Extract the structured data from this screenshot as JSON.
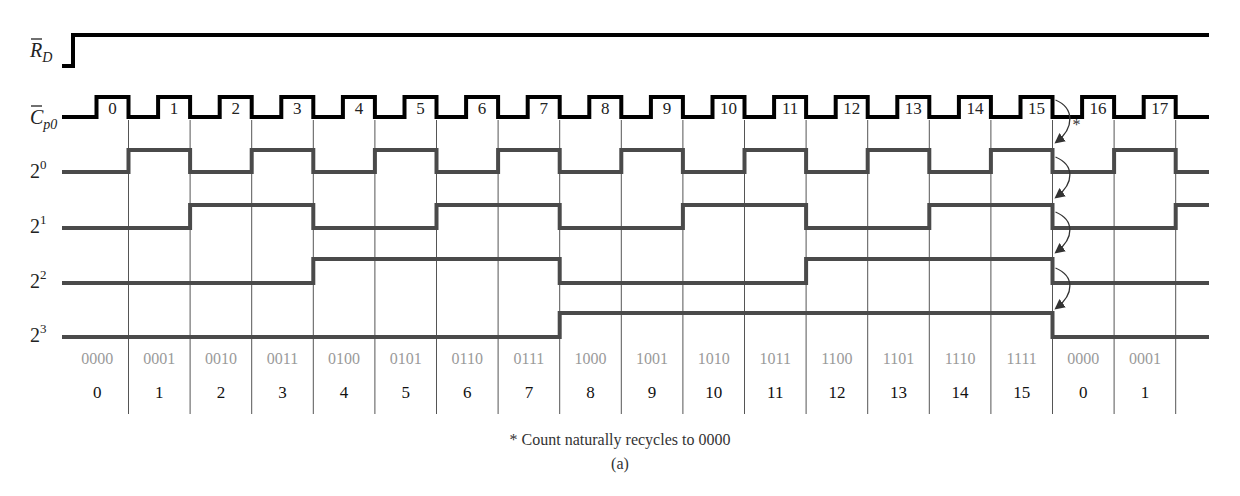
{
  "figure": {
    "caption_note": "* Count naturally recycles to 0000",
    "caption_label": "(a)",
    "recycle_marker": "*"
  },
  "signals": [
    {
      "name": "RD_bar",
      "label_main": "R",
      "label_sub": "D",
      "overbar": true
    },
    {
      "name": "Cp0_bar",
      "label_main": "C",
      "label_sub": "p0",
      "overbar": true
    },
    {
      "name": "bit0",
      "label_main": "2",
      "label_sup": "0"
    },
    {
      "name": "bit1",
      "label_main": "2",
      "label_sup": "1"
    },
    {
      "name": "bit2",
      "label_main": "2",
      "label_sup": "2"
    },
    {
      "name": "bit3",
      "label_main": "2",
      "label_sup": "3"
    }
  ],
  "clock_pulse_numbers": [
    "0",
    "1",
    "2",
    "3",
    "4",
    "5",
    "6",
    "7",
    "8",
    "9",
    "10",
    "11",
    "12",
    "13",
    "14",
    "15",
    "16",
    "17"
  ],
  "states_binary": [
    "0000",
    "0001",
    "0010",
    "0011",
    "0100",
    "0101",
    "0110",
    "0111",
    "1000",
    "1001",
    "1010",
    "1011",
    "1100",
    "1101",
    "1110",
    "1111",
    "0000",
    "0001"
  ],
  "states_decimal": [
    "0",
    "1",
    "2",
    "3",
    "4",
    "5",
    "6",
    "7",
    "8",
    "9",
    "10",
    "11",
    "12",
    "13",
    "14",
    "15",
    "0",
    "1"
  ],
  "colors": {
    "clock_line": "#000000",
    "output_line": "#4a4a4a",
    "grid_line": "#555555",
    "binary_text": "#9a9a9a",
    "decimal_text": "#111111"
  }
}
